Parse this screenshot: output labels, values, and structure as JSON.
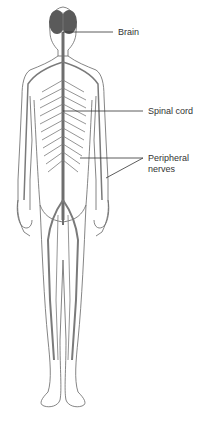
{
  "diagram": {
    "labels": [
      {
        "id": "brain",
        "text": "Brain"
      },
      {
        "id": "spinal_cord",
        "text": "Spinal cord"
      },
      {
        "id": "peripheral_nerves_line1",
        "text": "Peripheral"
      },
      {
        "id": "peripheral_nerves_line2",
        "text": "nerves"
      }
    ],
    "colors": {
      "outline": "#555555",
      "nerve": "#6e6e6e",
      "brain": "#5a5a5a",
      "label": "#333333"
    }
  }
}
